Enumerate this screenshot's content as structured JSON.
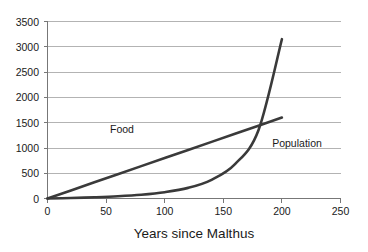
{
  "chart_data": {
    "type": "line",
    "title": "",
    "xlabel": "Years since Malthus",
    "ylabel": "",
    "xlim": [
      0,
      250
    ],
    "ylim": [
      0,
      3500
    ],
    "grid": true,
    "legend_position": "inline-annotations",
    "x_ticks": [
      0,
      50,
      100,
      150,
      200,
      250
    ],
    "y_ticks": [
      0,
      500,
      1000,
      1500,
      2000,
      2500,
      3000,
      3500
    ],
    "x_tick_labels": [
      "0",
      "50",
      "100",
      "150",
      "200",
      "250"
    ],
    "y_tick_labels": [
      "0",
      "500",
      "1000",
      "1500",
      "2000",
      "2500",
      "3000",
      "3500"
    ],
    "colors": {
      "series": "#3a3a3a",
      "gridline": "#b3b3b3",
      "axis": "#777777",
      "text": "#1a1a1a",
      "background": "#ffffff"
    },
    "x": [
      0,
      20,
      40,
      60,
      80,
      100,
      120,
      140,
      160,
      180,
      200
    ],
    "series": [
      {
        "name": "Food",
        "label": "Food",
        "values": [
          0,
          160,
          320,
          480,
          640,
          800,
          960,
          1120,
          1280,
          1440,
          1600
        ]
      },
      {
        "name": "Population",
        "label": "Population",
        "values": [
          0,
          10,
          25,
          45,
          75,
          125,
          210,
          370,
          680,
          1350,
          3150
        ]
      }
    ],
    "annotations": [
      {
        "text": "Food",
        "x": 60,
        "y": 1850
      },
      {
        "text": "Population",
        "x": 205,
        "y": 1150
      }
    ],
    "crossover": {
      "x": 175,
      "y": 1400
    }
  }
}
